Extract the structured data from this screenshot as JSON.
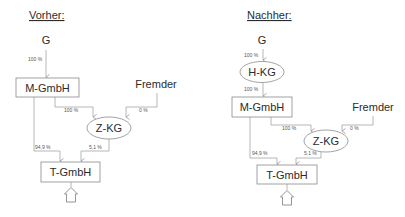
{
  "diagram": {
    "panels": [
      {
        "title": "Vorher:",
        "nodes": {
          "g": "G",
          "m_gmbh": "M-GmbH",
          "fremder": "Fremder",
          "z_kg": "Z-KG",
          "t_gmbh": "T-GmbH"
        },
        "edges": {
          "g_to_m": "100 %",
          "m_to_z": "100 %",
          "fremder_to_z": "0 %",
          "m_to_t": "94,9 %",
          "z_to_t": "5,1 %"
        }
      },
      {
        "title": "Nachher:",
        "nodes": {
          "g": "G",
          "h_kg": "H-KG",
          "m_gmbh": "M-GmbH",
          "fremder": "Fremder",
          "z_kg": "Z-KG",
          "t_gmbh": "T-GmbH"
        },
        "edges": {
          "g_to_h": "100 %",
          "h_to_m": "100 %",
          "m_to_z": "100 %",
          "fremder_to_z": "0 %",
          "m_to_t": "94,9 %",
          "z_to_t": "5,1 %"
        }
      }
    ],
    "icons": [
      "house-icon",
      "house-icon"
    ]
  }
}
